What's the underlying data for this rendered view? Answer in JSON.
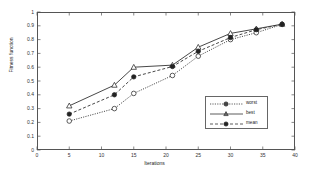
{
  "chart_data": {
    "type": "line",
    "title": "",
    "xlabel": "Iterations",
    "ylabel": "Fitness function",
    "xlim": [
      0,
      40
    ],
    "ylim": [
      0,
      1
    ],
    "xticks": [
      0,
      5,
      10,
      15,
      20,
      25,
      30,
      35,
      40
    ],
    "xtick_labels": [
      "0",
      "5",
      "10",
      "15",
      "20",
      "25",
      "30",
      "35",
      "40"
    ],
    "yticks": [
      0,
      0.1,
      0.2,
      0.3,
      0.4,
      0.5,
      0.6,
      0.7,
      0.8,
      0.9,
      1
    ],
    "ytick_labels": [
      "0",
      "0.1",
      "0.2",
      "0.3",
      "0.4",
      "0.5",
      "0.6",
      "0.7",
      "0.8",
      "0.9",
      "1"
    ],
    "grid": false,
    "legend_position": "right-center",
    "x": [
      5,
      12,
      15,
      21,
      25,
      30,
      34,
      38
    ],
    "series": [
      {
        "name": "worst",
        "marker": "circle-open",
        "line_style": "dotted",
        "color": "#333333",
        "values": [
          0.21,
          0.3,
          0.41,
          0.54,
          0.68,
          0.8,
          0.85,
          0.91
        ]
      },
      {
        "name": "best",
        "marker": "triangle-open",
        "line_style": "solid",
        "color": "#333333",
        "values": [
          0.32,
          0.47,
          0.6,
          0.615,
          0.745,
          0.845,
          0.878,
          0.912
        ]
      },
      {
        "name": "mean",
        "marker": "circle-filled",
        "line_style": "dashed",
        "color": "#333333",
        "values": [
          0.26,
          0.4,
          0.53,
          0.605,
          0.715,
          0.815,
          0.872,
          0.911
        ]
      }
    ]
  },
  "legend": {
    "items": [
      {
        "label": "worst"
      },
      {
        "label": "best"
      },
      {
        "label": "mean"
      }
    ]
  }
}
